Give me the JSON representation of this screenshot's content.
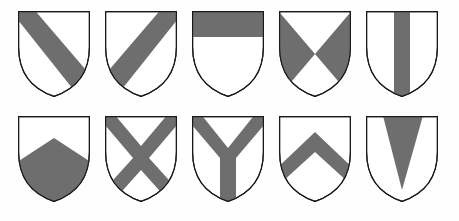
{
  "figure": {
    "kind": "heraldic-ordinaries-plate",
    "shield_count": 10,
    "rows": 2,
    "columns": 5,
    "background_color": "#fefefe",
    "field_color": "#ffffff",
    "charge_color": "#6e6e6e",
    "outline_color": "#1a1a1a"
  },
  "shields": [
    {
      "index": 1,
      "row": 1,
      "column": 1,
      "name": "bend",
      "description": "A diagonal band running from the upper left (dexter chief) to the lower right (sinister base).",
      "charge_color": "#6e6e6e",
      "field_color": "#ffffff",
      "x": 18,
      "y": 11,
      "width": 72,
      "height": 86
    },
    {
      "index": 2,
      "row": 1,
      "column": 2,
      "name": "bend sinister",
      "description": "A diagonal band running from the upper right (sinister chief) to the lower left (dexter base).",
      "charge_color": "#6e6e6e",
      "field_color": "#ffffff",
      "x": 105,
      "y": 11,
      "width": 72,
      "height": 86
    },
    {
      "index": 3,
      "row": 1,
      "column": 3,
      "name": "chief",
      "description": "A horizontal band occupying the top third of the shield.",
      "charge_color": "#6e6e6e",
      "field_color": "#ffffff",
      "x": 192,
      "y": 11,
      "width": 72,
      "height": 86
    },
    {
      "index": 4,
      "row": 1,
      "column": 4,
      "name": "per saltire",
      "description": "The shield divided by diagonals into four parts; the flank triangles are tinctured and the chief and base triangles are plain.",
      "charge_color": "#6e6e6e",
      "field_color": "#ffffff",
      "x": 279,
      "y": 11,
      "width": 72,
      "height": 86
    },
    {
      "index": 5,
      "row": 1,
      "column": 5,
      "name": "pale",
      "description": "A vertical band down the centre of the shield.",
      "charge_color": "#6e6e6e",
      "field_color": "#ffffff",
      "x": 366,
      "y": 11,
      "width": 72,
      "height": 86
    },
    {
      "index": 6,
      "row": 2,
      "column": 1,
      "name": "point pointed",
      "description": "The lower portion of the shield tinctured, its upper edge rising to a point in the centre.",
      "charge_color": "#6e6e6e",
      "field_color": "#ffffff",
      "x": 18,
      "y": 116,
      "width": 72,
      "height": 86
    },
    {
      "index": 7,
      "row": 2,
      "column": 2,
      "name": "saltire",
      "description": "A diagonal cross, like the letter X, spanning corner to corner.",
      "charge_color": "#6e6e6e",
      "field_color": "#ffffff",
      "x": 105,
      "y": 116,
      "width": 72,
      "height": 86
    },
    {
      "index": 8,
      "row": 2,
      "column": 3,
      "name": "pall",
      "description": "A Y-shaped ordinary with two arms to the chief corners and one to the base point.",
      "charge_color": "#6e6e6e",
      "field_color": "#ffffff",
      "x": 192,
      "y": 116,
      "width": 72,
      "height": 86
    },
    {
      "index": 9,
      "row": 2,
      "column": 4,
      "name": "chevron",
      "description": "An inverted V-shaped band meeting at a point toward the chief.",
      "charge_color": "#6e6e6e",
      "field_color": "#ffffff",
      "x": 279,
      "y": 116,
      "width": 72,
      "height": 86
    },
    {
      "index": 10,
      "row": 2,
      "column": 5,
      "name": "pile",
      "description": "A wedge issuing from the chief and tapering to a point toward the base.",
      "charge_color": "#6e6e6e",
      "field_color": "#ffffff",
      "x": 366,
      "y": 116,
      "width": 72,
      "height": 86
    }
  ]
}
